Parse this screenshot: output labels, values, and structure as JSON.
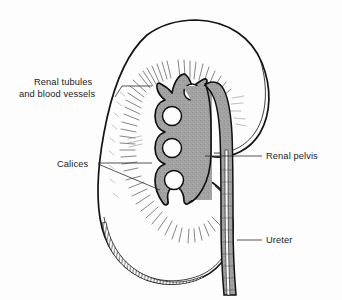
{
  "figure": {
    "background_color": "#fdfdfd",
    "ink_color": "#141414",
    "pelvis_fill_color": "#a3a3a3",
    "label_color": "#1b1b1b",
    "width": 342,
    "height": 300
  },
  "labels": {
    "renal_tubules_line1": "Renal tubules",
    "renal_tubules_line2": "and blood vessels",
    "calices": "Calices",
    "renal_pelvis": "Renal pelvis",
    "ureter": "Ureter"
  },
  "structures": [
    {
      "id": "renal-capsule",
      "name": "Renal capsule outline"
    },
    {
      "id": "cortex",
      "name": "Renal cortex"
    },
    {
      "id": "medullary-rays",
      "name": "Renal tubules and blood vessels"
    },
    {
      "id": "calices",
      "name": "Calices"
    },
    {
      "id": "renal-pelvis",
      "name": "Renal pelvis"
    },
    {
      "id": "ureter",
      "name": "Ureter"
    }
  ]
}
